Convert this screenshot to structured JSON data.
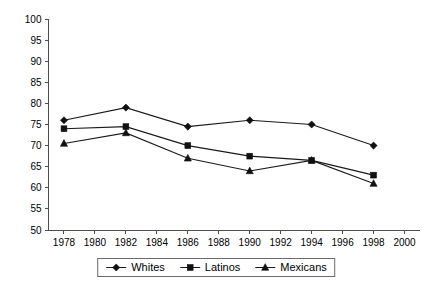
{
  "chart_data": {
    "type": "line",
    "title": "",
    "subtitle": "",
    "xlabel": "",
    "ylabel": "",
    "x": [
      1978,
      1982,
      1986,
      1990,
      1994,
      1998
    ],
    "xlim": [
      1977,
      2001
    ],
    "ylim": [
      50,
      100
    ],
    "ytick_step": 5,
    "xtick_step": 2,
    "grid": false,
    "legend_position": "bottom-center",
    "xticks": [
      "1978",
      "1980",
      "1982",
      "1984",
      "1986",
      "1988",
      "1990",
      "1992",
      "1994",
      "1996",
      "1998",
      "2000"
    ],
    "xtick_values": [
      1978,
      1980,
      1982,
      1984,
      1986,
      1988,
      1990,
      1992,
      1994,
      1996,
      1998,
      2000
    ],
    "yticks": [
      "50",
      "55",
      "60",
      "65",
      "70",
      "75",
      "80",
      "85",
      "90",
      "95",
      "100"
    ],
    "ytick_values": [
      50,
      55,
      60,
      65,
      70,
      75,
      80,
      85,
      90,
      95,
      100
    ],
    "series": [
      {
        "name": "Whites",
        "marker": "diamond",
        "color": "#111111",
        "values": [
          76,
          79,
          74.5,
          76,
          75,
          70
        ]
      },
      {
        "name": "Latinos",
        "marker": "square",
        "color": "#111111",
        "values": [
          74,
          74.5,
          70,
          67.5,
          66.5,
          63
        ]
      },
      {
        "name": "Mexicans",
        "marker": "triangle",
        "color": "#111111",
        "values": [
          70.5,
          73,
          67,
          64,
          66.5,
          61
        ]
      }
    ]
  },
  "legend": {
    "items": [
      {
        "label": "Whites",
        "marker": "diamond"
      },
      {
        "label": "Latinos",
        "marker": "square"
      },
      {
        "label": "Mexicans",
        "marker": "triangle"
      }
    ]
  },
  "colors": {
    "axis": "#4d4d4d",
    "line": "#1a1a1a",
    "marker": "#111111",
    "background": "#ffffff",
    "legend_border": "#6b6b6b"
  }
}
